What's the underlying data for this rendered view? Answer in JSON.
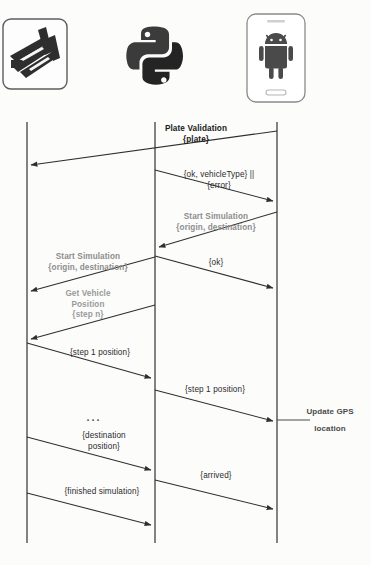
{
  "diagram": {
    "type": "uml-sequence-diagram",
    "background_color": "#fcfcfb",
    "line_color": "#3a3a3a",
    "actors": [
      {
        "id": "sumo",
        "icon": "sumo-traffic-simulator-icon",
        "lifeline_x": 27,
        "lifeline_top": 122,
        "lifeline_bottom": 543
      },
      {
        "id": "python",
        "icon": "python-logo-icon",
        "lifeline_x": 155,
        "lifeline_top": 122,
        "lifeline_bottom": 543
      },
      {
        "id": "android",
        "icon": "android-phone-icon",
        "lifeline_x": 277,
        "lifeline_top": 122,
        "lifeline_bottom": 543
      }
    ],
    "messages": [
      {
        "id": "m1",
        "label": "Plate Validation\n{plate}",
        "style": "bold",
        "from": "android",
        "to": "python",
        "y_start": 131,
        "y_end": 165,
        "label_x": 196,
        "label_y": 124
      },
      {
        "id": "m2",
        "label": "{ok, vehicleType} ||\n{error}",
        "style": "plain",
        "from": "python",
        "to": "android",
        "y_start": 170,
        "y_end": 201,
        "label_x": 219,
        "label_y": 170
      },
      {
        "id": "m3",
        "label": "Start Simulation\n{origin, destination}",
        "style": "grey",
        "from": "android",
        "to": "python",
        "y_start": 212,
        "y_end": 247,
        "label_x": 216,
        "label_y": 212
      },
      {
        "id": "m4",
        "label": "Start Simulation\n{origin, destination}",
        "style": "grey",
        "from": "python",
        "to": "sumo",
        "y_start": 257,
        "y_end": 291,
        "label_x": 88,
        "label_y": 252
      },
      {
        "id": "m5",
        "label": "{ok}",
        "style": "plain",
        "from": "python",
        "to": "android",
        "y_start": 256,
        "y_end": 288,
        "label_x": 216,
        "label_y": 258
      },
      {
        "id": "m6",
        "label": "Get Vehicle\nPosition\n{step n}",
        "style": "grey2",
        "from": "python",
        "to": "sumo",
        "y_start": 305,
        "y_end": 339,
        "label_x": 88,
        "label_y": 289
      },
      {
        "id": "m7",
        "label": "{step 1 position}",
        "style": "plain",
        "from": "sumo",
        "to": "python",
        "y_start": 343,
        "y_end": 378,
        "label_x": 100,
        "label_y": 348
      },
      {
        "id": "m8",
        "label": "{step 1 position}",
        "style": "plain",
        "from": "python",
        "to": "android",
        "y_start": 390,
        "y_end": 421,
        "label_x": 215,
        "label_y": 385
      },
      {
        "id": "m9",
        "label": "{destination\nposition}",
        "style": "plain",
        "from": "sumo",
        "to": "python",
        "y_start": 437,
        "y_end": 470,
        "label_x": 104,
        "label_y": 431
      },
      {
        "id": "m10",
        "label": "{arrived}",
        "style": "plain",
        "from": "python",
        "to": "android",
        "y_start": 480,
        "y_end": 509,
        "label_x": 216,
        "label_y": 471
      },
      {
        "id": "m11",
        "label": "{finished simulation}",
        "style": "plain",
        "from": "sumo",
        "to": "python",
        "y_start": 493,
        "y_end": 525,
        "label_x": 102,
        "label_y": 487
      }
    ],
    "ellipsis": {
      "text": "...",
      "x": 94,
      "y": 412
    },
    "notes": [
      {
        "id": "n1",
        "label": "Update GPS\nlocation",
        "anchor": "android",
        "y": 420,
        "label_x": 330,
        "label_y": 405
      }
    ]
  }
}
